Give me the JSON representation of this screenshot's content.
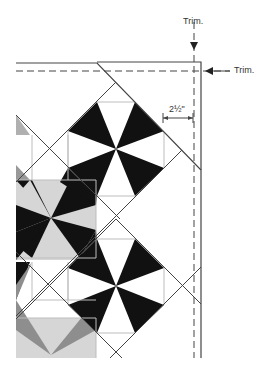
{
  "labels": {
    "trim_top": "Trim.",
    "trim_right": "Trim.",
    "dimension": "2½\""
  },
  "colors": {
    "black": "#111111",
    "light_gray": "#d6d6d6",
    "mid_gray": "#8e8e8e",
    "line": "#444444",
    "grid": "#bdbdbd"
  }
}
